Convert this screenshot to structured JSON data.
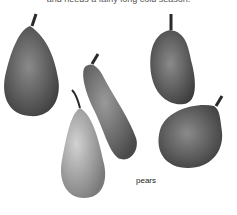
{
  "document": {
    "top_text": "and needs a fairly long cold season."
  },
  "figure": {
    "caption": "pears",
    "subject": "pears",
    "count": 5,
    "colors": {
      "background": "#ffffff",
      "pear_dark": "#3f3f3f",
      "pear_mid": "#6e6e6e",
      "pear_light": "#b5b5b5",
      "stem": "#2a2a2a"
    }
  }
}
